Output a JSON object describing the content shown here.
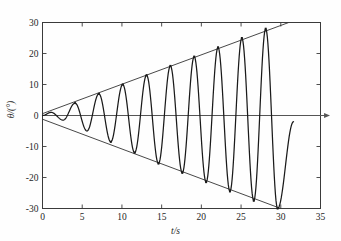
{
  "chart_data": {
    "type": "line",
    "title": "",
    "xlabel": "t/s",
    "ylabel": "θ/(°)",
    "xlim": [
      0,
      35
    ],
    "ylim": [
      -30,
      30
    ],
    "xticks": [
      0,
      5,
      10,
      15,
      20,
      25,
      30,
      35
    ],
    "yticks": [
      -30,
      -20,
      -10,
      0,
      10,
      20,
      30
    ],
    "xticklabels": [
      "0",
      "5",
      "10",
      "15",
      "20",
      "25",
      "30",
      "35"
    ],
    "yticklabels": [
      "-30",
      "-20",
      "-10",
      "0",
      "10",
      "20",
      "30"
    ],
    "grid": false,
    "legend": null,
    "series": [
      {
        "name": "oscillation",
        "description": "growing amplitude oscillation, period about 3 s, starts at origin moving negative",
        "period": 3.0,
        "t_start": 0.0,
        "t_end": 31.6,
        "peaks": [
          {
            "t": 1.1,
            "theta": 1.0
          },
          {
            "t": 4.1,
            "theta": 4.0
          },
          {
            "t": 7.1,
            "theta": 7.0
          },
          {
            "t": 10.1,
            "theta": 10.0
          },
          {
            "t": 13.1,
            "theta": 13.0
          },
          {
            "t": 16.1,
            "theta": 16.0
          },
          {
            "t": 19.1,
            "theta": 19.0
          },
          {
            "t": 22.1,
            "theta": 22.0
          },
          {
            "t": 25.1,
            "theta": 25.0
          },
          {
            "t": 28.1,
            "theta": 28.0
          }
        ],
        "troughs": [
          {
            "t": 2.6,
            "theta": -1.5
          },
          {
            "t": 5.6,
            "theta": -5.0
          },
          {
            "t": 8.6,
            "theta": -8.5
          },
          {
            "t": 11.6,
            "theta": -12.0
          },
          {
            "t": 14.6,
            "theta": -15.5
          },
          {
            "t": 17.6,
            "theta": -18.5
          },
          {
            "t": 20.6,
            "theta": -21.5
          },
          {
            "t": 23.6,
            "theta": -24.5
          },
          {
            "t": 26.6,
            "theta": -27.5
          },
          {
            "t": 29.6,
            "theta": -30.0
          }
        ],
        "end_point": {
          "t": 31.6,
          "theta": -2.0
        }
      },
      {
        "name": "upper-envelope",
        "type": "straight-line",
        "from": {
          "t": 0.0,
          "theta": 0.6
        },
        "to": {
          "t": 31.0,
          "theta": 30.0
        }
      },
      {
        "name": "lower-envelope",
        "type": "straight-line",
        "from": {
          "t": 0.0,
          "theta": -1.2
        },
        "to": {
          "t": 30.0,
          "theta": -30.0
        }
      },
      {
        "name": "zero-axis-arrow",
        "type": "horizontal-line-with-arrow",
        "theta": 0.0,
        "from_t": 0.0,
        "to_t": 36.2
      }
    ],
    "colors": {
      "curve": "#1a1a1a",
      "envelope": "#333333",
      "frame": "#3a3a3a",
      "zero_line": "#555555",
      "background": "#fefefe"
    }
  }
}
